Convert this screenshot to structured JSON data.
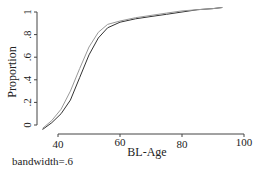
{
  "chart_data": {
    "type": "line",
    "title": "",
    "xlabel": "BL-Age",
    "ylabel": "Proportion",
    "annotation": "bandwidth=.6",
    "xlim": [
      33,
      100
    ],
    "ylim": [
      -0.05,
      1.05
    ],
    "xticks": [
      40,
      60,
      80,
      100
    ],
    "xtick_labels": [
      "40",
      "60",
      "80",
      "100"
    ],
    "yticks": [
      0,
      0.2,
      0.4,
      0.6,
      0.8,
      1
    ],
    "ytick_labels": [
      "0",
      ".2",
      ".4",
      ".6",
      ".8",
      "1"
    ],
    "grid": false,
    "legend": null,
    "series": [
      {
        "name": "smooth-dark",
        "color": "#333333",
        "x": [
          35,
          38,
          41,
          44,
          47,
          50,
          53,
          56,
          60,
          65,
          70,
          75,
          80,
          85,
          90,
          93
        ],
        "y": [
          -0.04,
          0.02,
          0.1,
          0.22,
          0.42,
          0.62,
          0.77,
          0.86,
          0.91,
          0.94,
          0.96,
          0.98,
          1.0,
          1.02,
          1.03,
          1.04
        ]
      },
      {
        "name": "smooth-light",
        "color": "#999999",
        "x": [
          35,
          38,
          41,
          44,
          47,
          50,
          53,
          56,
          60,
          65,
          70,
          75,
          80,
          85,
          90,
          93
        ],
        "y": [
          -0.03,
          0.04,
          0.14,
          0.3,
          0.5,
          0.69,
          0.82,
          0.89,
          0.92,
          0.95,
          0.97,
          0.99,
          1.01,
          1.02,
          1.03,
          1.04
        ]
      }
    ]
  }
}
